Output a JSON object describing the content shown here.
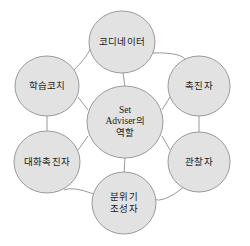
{
  "diagram": {
    "type": "hub-and-spoke",
    "background_color": "#ffffff",
    "node_fill_color": "#e2e2e2",
    "node_stroke_color": "#9a9a9a",
    "connector_color": "#9a9a9a",
    "text_color": "#1a1a1a",
    "center": {
      "id": "set-adviser-role",
      "lines": [
        "Set",
        "Adviser의",
        "역할"
      ],
      "full_text": "Set Adviser의 역할",
      "cx": 125,
      "cy": 122,
      "rx": 38,
      "ry": 36
    },
    "nodes": [
      {
        "id": "coordinator",
        "lines": [
          "코디네이터"
        ],
        "full_text": "코디네이터",
        "cx": 122,
        "cy": 42,
        "rx": 33,
        "ry": 31
      },
      {
        "id": "facilitator",
        "lines": [
          "촉진자"
        ],
        "full_text": "촉진자",
        "cx": 199,
        "cy": 86,
        "rx": 31,
        "ry": 30
      },
      {
        "id": "observer",
        "lines": [
          "관찰자"
        ],
        "full_text": "관찰자",
        "cx": 199,
        "cy": 162,
        "rx": 31,
        "ry": 30
      },
      {
        "id": "atmosphere-creator",
        "lines": [
          "분위기",
          "조성자"
        ],
        "full_text": "분위기 조성자",
        "cx": 124,
        "cy": 203,
        "rx": 32,
        "ry": 31
      },
      {
        "id": "conversation-facilitator",
        "lines": [
          "대화촉진자"
        ],
        "full_text": "대화촉진자",
        "cx": 47,
        "cy": 162,
        "rx": 33,
        "ry": 31
      },
      {
        "id": "learning-coach",
        "lines": [
          "학습코치"
        ],
        "full_text": "학습코치",
        "cx": 47,
        "cy": 86,
        "rx": 32,
        "ry": 30
      }
    ],
    "spokes": [
      {
        "id": "spoke-center-coordinator",
        "x1": 125,
        "y1": 88,
        "x2": 123,
        "y2": 72
      },
      {
        "id": "spoke-center-facilitator",
        "x1": 162,
        "y1": 110,
        "x2": 170,
        "y2": 97
      },
      {
        "id": "spoke-center-observer",
        "x1": 162,
        "y1": 136,
        "x2": 170,
        "y2": 150
      },
      {
        "id": "spoke-center-atmosphere",
        "x1": 125,
        "y1": 157,
        "x2": 124,
        "y2": 173
      },
      {
        "id": "spoke-center-conversation",
        "x1": 88,
        "y1": 136,
        "x2": 78,
        "y2": 150
      },
      {
        "id": "spoke-center-learning",
        "x1": 88,
        "y1": 110,
        "x2": 78,
        "y2": 97
      }
    ],
    "ring_connectors": [
      {
        "id": "arc-learning-coordinator",
        "path": "M 74,70 Q 97,47 90,38",
        "shape": "arc"
      },
      {
        "id": "arc-coordinator-facilitator",
        "path": "M 152,53 Q 183,52 186,61",
        "shape": "arc"
      },
      {
        "id": "line-facilitator-observer",
        "path": "M 199,116 L 199,132",
        "shape": "line"
      },
      {
        "id": "arc-observer-atmosphere",
        "path": "M 184,187 Q 163,204 153,199",
        "shape": "arc"
      },
      {
        "id": "arc-atmosphere-conversation",
        "path": "M 94,194 Q 72,186 64,190",
        "shape": "arc"
      },
      {
        "id": "line-conversation-learning",
        "path": "M 47,131 L 47,116",
        "shape": "line"
      }
    ]
  }
}
